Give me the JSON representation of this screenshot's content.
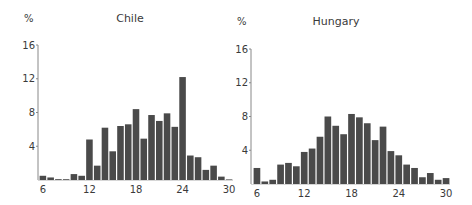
{
  "chart_data": [
    {
      "type": "bar",
      "title": "Chile",
      "ylabel": "%",
      "xlabel": "",
      "ylim": [
        0,
        16
      ],
      "xlim": [
        6,
        30
      ],
      "yticks": [
        4,
        8,
        12,
        16
      ],
      "ytick_labels": [
        "4",
        "8",
        "12",
        "16"
      ],
      "xticks": [
        6,
        12,
        18,
        24,
        30
      ],
      "xtick_labels": [
        "6",
        "12",
        "18",
        "24",
        "30"
      ],
      "grid": false,
      "legend": null,
      "bar_color": "#4a4a4a",
      "categories": [
        6,
        7,
        8,
        9,
        10,
        11,
        12,
        13,
        14,
        15,
        16,
        17,
        18,
        19,
        20,
        21,
        22,
        23,
        24,
        25,
        26,
        27,
        28,
        29,
        30
      ],
      "values": [
        0.5,
        0.3,
        0.1,
        0.05,
        0.7,
        0.5,
        4.8,
        1.7,
        6.2,
        3.4,
        6.4,
        6.6,
        8.4,
        4.9,
        7.7,
        7.0,
        7.9,
        6.3,
        12.2,
        2.9,
        2.7,
        1.2,
        1.7,
        0.4,
        0.0
      ]
    },
    {
      "type": "bar",
      "title": "Hungary",
      "ylabel": "%",
      "xlabel": "",
      "ylim": [
        0,
        16
      ],
      "xlim": [
        6,
        30
      ],
      "yticks": [
        4,
        8,
        12,
        16
      ],
      "ytick_labels": [
        "4",
        "8",
        "12",
        "16"
      ],
      "xticks": [
        6,
        12,
        18,
        24,
        30
      ],
      "xtick_labels": [
        "6",
        "12",
        "18",
        "24",
        "30"
      ],
      "grid": false,
      "legend": null,
      "bar_color": "#4a4a4a",
      "categories": [
        6,
        7,
        8,
        9,
        10,
        11,
        12,
        13,
        14,
        15,
        16,
        17,
        18,
        19,
        20,
        21,
        22,
        23,
        24,
        25,
        26,
        27,
        28,
        29,
        30
      ],
      "values": [
        1.9,
        0.3,
        0.5,
        2.3,
        2.5,
        2.1,
        3.8,
        4.2,
        5.6,
        8.0,
        6.9,
        5.9,
        8.3,
        7.9,
        7.2,
        5.2,
        6.8,
        3.9,
        3.4,
        2.3,
        1.9,
        0.8,
        1.3,
        0.5,
        0.7
      ]
    }
  ]
}
